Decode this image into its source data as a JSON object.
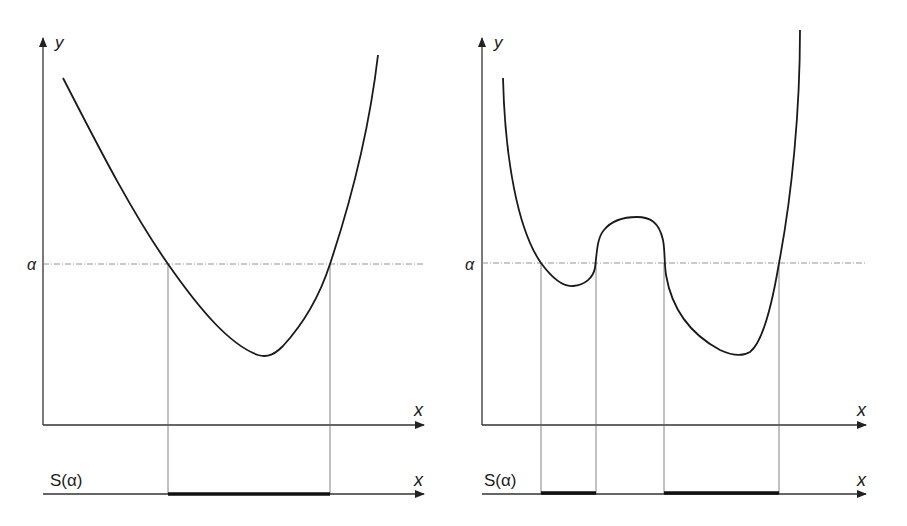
{
  "panels": [
    {
      "id": "left",
      "y_axis_label": "y",
      "x_axis_label": "x",
      "alpha_label": "α",
      "set_label": "S(α)",
      "set_axis_label": "x",
      "description": "Convex function with single minimum; sublevel set S(α) is one interval"
    },
    {
      "id": "right",
      "y_axis_label": "y",
      "x_axis_label": "x",
      "alpha_label": "α",
      "set_label": "S(α)",
      "set_axis_label": "x",
      "description": "Non-convex function with two minima; sublevel set S(α) is two disjoint intervals"
    }
  ],
  "colors": {
    "curve": "#1a1a1a",
    "axis": "#333333",
    "guide": "#666666",
    "alpha_line": "#888888",
    "set_segment": "#111111"
  }
}
